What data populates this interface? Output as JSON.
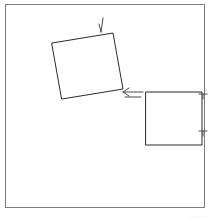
{
  "figure": {
    "background_color": "#ffffff",
    "stroke_color": "#2b2b2b",
    "frame_color": "#7d7d7d",
    "marker_color": "#4a4a4a",
    "caption_color": "#c9c9c9"
  },
  "frame": {
    "label": "outer border frame",
    "x": 5,
    "y": 4,
    "width": 200,
    "height": 204,
    "stroke_width": 1
  },
  "shapes": [
    {
      "id": "square-rotated",
      "label": "rotated square",
      "type": "quadrilateral",
      "rotation_degrees": -7,
      "stroke_width": 1,
      "points": "52,43 113,33 123,89 62,99",
      "corners": [
        {
          "x": 52,
          "y": 43
        },
        {
          "x": 113,
          "y": 33
        },
        {
          "x": 123,
          "y": 89
        },
        {
          "x": 62,
          "y": 99
        }
      ]
    },
    {
      "id": "square-aligned",
      "label": "axis aligned square",
      "type": "quadrilateral",
      "rotation_degrees": 0,
      "stroke_width": 1,
      "points": "146,92 202,92 202,145 146,145",
      "corners": [
        {
          "x": 146,
          "y": 92
        },
        {
          "x": 202,
          "y": 92
        },
        {
          "x": 202,
          "y": 145
        },
        {
          "x": 146,
          "y": 145
        }
      ]
    }
  ],
  "markers": [
    {
      "id": "marker-top-tick",
      "label": "tick mark above rotated square",
      "icon": "tick-arrow-icon",
      "path": "M 103,18 L 101,32 M 101,32 L 99,24",
      "stroke_width": 1
    },
    {
      "id": "marker-center-arrow",
      "label": "left pointing arrow between squares",
      "icon": "arrow-left-icon",
      "path": "M 143,92 L 123,92 M 123,92 L 129,88 M 123,92 L 129,96 M 141,97 L 125,97",
      "stroke_width": 1
    },
    {
      "id": "marker-right-top",
      "label": "tick on right edge upper",
      "icon": "tick-right-icon",
      "path": "M 207,94 L 199,94 M 203,94 L 203,99",
      "stroke_width": 1
    },
    {
      "id": "marker-right-bottom",
      "label": "tick on right edge lower",
      "icon": "tick-right-icon",
      "path": "M 207,131 L 199,131 M 203,131 L 203,136",
      "stroke_width": 1
    }
  ],
  "caption": {
    "text": "· ·   ·    ·  ·",
    "visible": true
  }
}
